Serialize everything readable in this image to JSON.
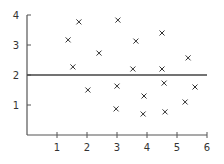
{
  "chart_data": {
    "type": "scatter",
    "title": "",
    "xlabel": "",
    "ylabel": "",
    "xlim": [
      0,
      6
    ],
    "ylim": [
      0,
      4
    ],
    "x_ticks": [
      1,
      2,
      3,
      4,
      5,
      6
    ],
    "y_ticks": [
      1,
      2,
      3,
      4
    ],
    "grid": false,
    "legend": null,
    "marker": "x",
    "reference_line": {
      "orientation": "horizontal",
      "y": 2,
      "x_range": [
        0,
        6
      ]
    },
    "series": [
      {
        "name": "points",
        "points": [
          {
            "x": 1.73,
            "y": 3.77
          },
          {
            "x": 1.37,
            "y": 3.17
          },
          {
            "x": 1.53,
            "y": 2.27
          },
          {
            "x": 3.03,
            "y": 3.83
          },
          {
            "x": 3.63,
            "y": 3.13
          },
          {
            "x": 2.4,
            "y": 2.73
          },
          {
            "x": 3.53,
            "y": 2.2
          },
          {
            "x": 4.5,
            "y": 3.4
          },
          {
            "x": 5.37,
            "y": 2.57
          },
          {
            "x": 4.5,
            "y": 2.2
          },
          {
            "x": 2.03,
            "y": 1.5
          },
          {
            "x": 3.0,
            "y": 1.63
          },
          {
            "x": 2.97,
            "y": 0.87
          },
          {
            "x": 4.57,
            "y": 1.73
          },
          {
            "x": 5.6,
            "y": 1.6
          },
          {
            "x": 3.9,
            "y": 1.3
          },
          {
            "x": 5.27,
            "y": 1.1
          },
          {
            "x": 3.87,
            "y": 0.7
          },
          {
            "x": 4.6,
            "y": 0.77
          }
        ]
      }
    ]
  },
  "colors": {
    "axis": "#555555",
    "marker": "#333333",
    "reference_line": "#444444",
    "background": "#ffffff"
  }
}
